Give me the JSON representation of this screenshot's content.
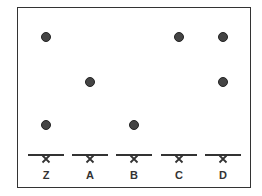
{
  "diagram": {
    "type": "paper-chromatogram",
    "lanes": [
      {
        "label": "Z",
        "x": 46,
        "spots_y": [
          37,
          125
        ]
      },
      {
        "label": "A",
        "x": 90,
        "spots_y": [
          82
        ]
      },
      {
        "label": "B",
        "x": 134,
        "spots_y": [
          125
        ]
      },
      {
        "label": "C",
        "x": 179,
        "spots_y": [
          37
        ]
      },
      {
        "label": "D",
        "x": 223,
        "spots_y": [
          37,
          82
        ]
      }
    ],
    "baseline_y": 155,
    "label_y": 175,
    "colors": {
      "spot": "#444444",
      "line": "#333333"
    }
  }
}
